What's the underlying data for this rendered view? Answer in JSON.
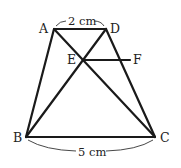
{
  "diagram": {
    "type": "trapezoid",
    "points": {
      "A": {
        "label": "A",
        "x": 54,
        "y": 29
      },
      "D": {
        "label": "D",
        "x": 106,
        "y": 29
      },
      "E": {
        "label": "E",
        "x": 83,
        "y": 60
      },
      "F": {
        "label": "F",
        "x": 130,
        "y": 60
      },
      "B": {
        "label": "B",
        "x": 26,
        "y": 137
      },
      "C": {
        "label": "C",
        "x": 155,
        "y": 137
      }
    },
    "segments": [
      "AD",
      "AB",
      "DC",
      "BC",
      "AC",
      "BD",
      "EF"
    ],
    "dimensions": {
      "top": "2 cm",
      "bottom": "5 cm"
    }
  }
}
